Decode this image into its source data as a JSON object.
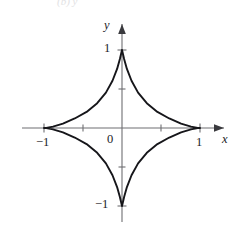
{
  "figure": {
    "name": "astroid-graph",
    "background_color": "#ffffff",
    "caption_remnant": "(b) y",
    "axis_color": "#6e6e72",
    "curve_color": "#16161a",
    "text_color": "#1b1b1f"
  },
  "labels": {
    "y_axis": "y",
    "x_axis": "x",
    "origin": "0",
    "x_neg_one": "−1",
    "x_pos_one": "1",
    "y_pos_one": "1",
    "y_neg_one": "−1"
  },
  "chart_data": {
    "type": "line",
    "title": "",
    "subtitle": "",
    "xlabel": "x",
    "ylabel": "y",
    "equation": "x^(2/3) + y^(2/3) = 1",
    "curve_name": "astroid",
    "grid": false,
    "legend": null,
    "xlim": [
      -1.28,
      1.28
    ],
    "ylim": [
      -1.38,
      1.38
    ],
    "xticks": [
      -1,
      -0.5,
      0.5,
      1
    ],
    "yticks": [
      -1,
      -0.5,
      0.5,
      1
    ],
    "xtick_labels": [
      "−1",
      "",
      "",
      "1"
    ],
    "ytick_labels": [
      "−1",
      "",
      "",
      "1"
    ],
    "cusps": [
      {
        "x": 1,
        "y": 0
      },
      {
        "x": 0,
        "y": 1
      },
      {
        "x": -1,
        "y": 0
      },
      {
        "x": 0,
        "y": -1
      }
    ],
    "series": [
      {
        "name": "astroid",
        "parametric": "x = cos^3(t), y = sin^3(t)",
        "x": [
          1.0,
          0.971,
          0.885,
          0.757,
          0.606,
          0.454,
          0.318,
          0.206,
          0.122,
          0.063,
          0.027,
          0.007,
          0.0,
          -0.007,
          -0.027,
          -0.063,
          -0.122,
          -0.206,
          -0.318,
          -0.454,
          -0.606,
          -0.757,
          -0.885,
          -0.971,
          -1.0,
          -0.971,
          -0.885,
          -0.757,
          -0.606,
          -0.454,
          -0.318,
          -0.206,
          -0.122,
          -0.063,
          -0.027,
          -0.007,
          0.0,
          0.007,
          0.027,
          0.063,
          0.122,
          0.206,
          0.318,
          0.454,
          0.606,
          0.757,
          0.885,
          0.971,
          1.0
        ],
        "y": [
          0.0,
          0.002,
          0.018,
          0.056,
          0.122,
          0.206,
          0.318,
          0.454,
          0.606,
          0.757,
          0.885,
          0.971,
          1.0,
          0.971,
          0.885,
          0.757,
          0.606,
          0.454,
          0.318,
          0.206,
          0.122,
          0.056,
          0.018,
          0.002,
          0.0,
          -0.002,
          -0.018,
          -0.056,
          -0.122,
          -0.206,
          -0.318,
          -0.454,
          -0.606,
          -0.757,
          -0.885,
          -0.971,
          -1.0,
          -0.971,
          -0.885,
          -0.757,
          -0.606,
          -0.454,
          -0.318,
          -0.206,
          -0.122,
          -0.056,
          -0.018,
          -0.002,
          0.0
        ]
      }
    ]
  }
}
